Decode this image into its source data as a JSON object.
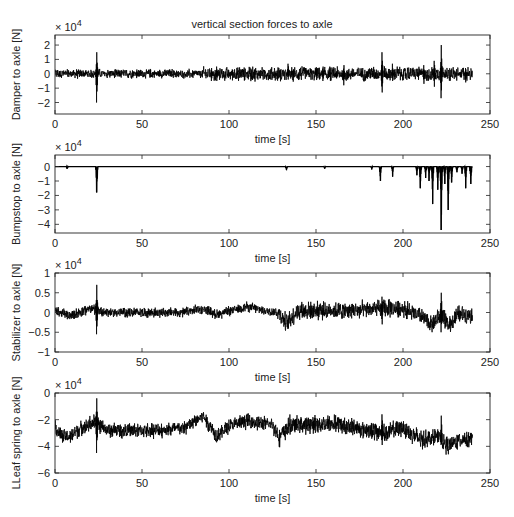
{
  "figure": {
    "title": "vertical section forces to axle",
    "width": 514,
    "height": 517
  },
  "chart_data": [
    {
      "type": "line",
      "title": "vertical section forces to axle",
      "xlabel": "time [s]",
      "ylabel": "Damper to axle [N]",
      "exponent_label": "× 10^4",
      "xlim": [
        0,
        250
      ],
      "ylim": [
        -2.8,
        2.7
      ],
      "xticks": [
        0,
        50,
        100,
        150,
        200,
        250
      ],
      "yticks": [
        -2,
        -1,
        0,
        1,
        2
      ],
      "ytick_labels": [
        "−2",
        "−1",
        "0",
        "1",
        "2"
      ],
      "grid": false,
      "series": [
        {
          "name": "Damper to axle",
          "color": "#000000",
          "t_end": 240,
          "baseline": 0,
          "noise_amplitude": 0.25,
          "spikes": [
            {
              "t": 24,
              "max": 1.5,
              "min": -2.0
            },
            {
              "t": 47,
              "max": 0.3,
              "min": -0.3
            },
            {
              "t": 90,
              "max": 0.4,
              "min": -0.5
            },
            {
              "t": 93,
              "max": 0.5,
              "min": -0.5
            },
            {
              "t": 134,
              "max": 0.7,
              "min": -0.4
            },
            {
              "t": 154,
              "max": 0.5,
              "min": -0.5
            },
            {
              "t": 166,
              "max": 0.6,
              "min": -0.8
            },
            {
              "t": 188,
              "max": 1.5,
              "min": -1.3
            },
            {
              "t": 194,
              "max": 0.7,
              "min": -0.5
            },
            {
              "t": 212,
              "max": 0.6,
              "min": -0.7
            },
            {
              "t": 218,
              "max": 0.9,
              "min": -0.9
            },
            {
              "t": 222,
              "max": 2.0,
              "min": -1.7
            },
            {
              "t": 236,
              "max": 0.4,
              "min": -0.6
            }
          ]
        }
      ]
    },
    {
      "type": "line",
      "title": "",
      "xlabel": "time [s]",
      "ylabel": "Bumpstop to axle [N]",
      "exponent_label": "× 10^4",
      "xlim": [
        0,
        250
      ],
      "ylim": [
        -4.6,
        0.8
      ],
      "xticks": [
        0,
        50,
        100,
        150,
        200,
        250
      ],
      "yticks": [
        -4,
        -3,
        -2,
        -1,
        0
      ],
      "ytick_labels": [
        "−4",
        "−3",
        "−2",
        "−1",
        "0"
      ],
      "grid": false,
      "series": [
        {
          "name": "Bumpstop to axle",
          "color": "#000000",
          "t_end": 240,
          "baseline": 0,
          "noise_amplitude": 0,
          "spikes": [
            {
              "t": 7,
              "max": 0,
              "min": -0.15
            },
            {
              "t": 24,
              "max": 0,
              "min": -1.8
            },
            {
              "t": 133,
              "max": 0,
              "min": -0.25
            },
            {
              "t": 155,
              "max": 0,
              "min": -0.15
            },
            {
              "t": 182,
              "max": 0,
              "min": -0.2
            },
            {
              "t": 187,
              "max": 0,
              "min": -1.0
            },
            {
              "t": 194,
              "max": 0,
              "min": -0.7
            },
            {
              "t": 208,
              "max": 0,
              "min": -0.6
            },
            {
              "t": 210,
              "max": 0,
              "min": -1.5
            },
            {
              "t": 213,
              "max": 0,
              "min": -0.8
            },
            {
              "t": 215,
              "max": 0,
              "min": -1.0
            },
            {
              "t": 217,
              "max": 0,
              "min": -2.6
            },
            {
              "t": 220,
              "max": 0,
              "min": -1.6
            },
            {
              "t": 222,
              "max": 0,
              "min": -4.4
            },
            {
              "t": 224,
              "max": 0,
              "min": -1.2
            },
            {
              "t": 226,
              "max": 0,
              "min": -3.0
            },
            {
              "t": 228,
              "max": 0,
              "min": -1.1
            },
            {
              "t": 231,
              "max": 0,
              "min": -0.4
            },
            {
              "t": 234,
              "max": 0,
              "min": -0.5
            },
            {
              "t": 236,
              "max": 0,
              "min": -1.5
            },
            {
              "t": 239,
              "max": 0,
              "min": -1.2
            }
          ]
        }
      ]
    },
    {
      "type": "line",
      "title": "",
      "xlabel": "time [s]",
      "ylabel": "Stabilizer to axle [N]",
      "exponent_label": "× 10^4",
      "xlim": [
        0,
        250
      ],
      "ylim": [
        -1,
        1
      ],
      "xticks": [
        0,
        50,
        100,
        150,
        200,
        250
      ],
      "yticks": [
        -1,
        -0.5,
        0,
        0.5,
        1
      ],
      "ytick_labels": [
        "−1",
        "−0.5",
        "0",
        "0.5",
        "1"
      ],
      "grid": false,
      "series": [
        {
          "name": "Stabilizer to axle",
          "color": "#000000",
          "t_end": 240,
          "trend": [
            [
              0,
              0.05
            ],
            [
              8,
              -0.08
            ],
            [
              20,
              0.1
            ],
            [
              30,
              0.0
            ],
            [
              60,
              0.0
            ],
            [
              75,
              0.0
            ],
            [
              85,
              0.1
            ],
            [
              93,
              -0.05
            ],
            [
              110,
              0.15
            ],
            [
              120,
              0.05
            ],
            [
              128,
              0.0
            ],
            [
              133,
              -0.25
            ],
            [
              140,
              0.05
            ],
            [
              170,
              0.05
            ],
            [
              190,
              0.1
            ],
            [
              200,
              0.1
            ],
            [
              210,
              -0.1
            ],
            [
              217,
              -0.3
            ],
            [
              222,
              -0.05
            ],
            [
              226,
              -0.35
            ],
            [
              232,
              -0.05
            ],
            [
              240,
              -0.05
            ]
          ],
          "noise_amplitude": 0.1,
          "spikes": [
            {
              "t": 24,
              "max": 0.7,
              "min": -0.55
            },
            {
              "t": 188,
              "max": 0.4,
              "min": -0.3
            },
            {
              "t": 222,
              "max": 0.5,
              "min": -0.5
            }
          ]
        }
      ]
    },
    {
      "type": "line",
      "title": "",
      "xlabel": "time [s]",
      "ylabel": "LLeaf spring to axle [N]",
      "exponent_label": "× 10^4",
      "xlim": [
        0,
        250
      ],
      "ylim": [
        -6,
        0
      ],
      "xticks": [
        0,
        50,
        100,
        150,
        200,
        250
      ],
      "yticks": [
        -6,
        -4,
        -2,
        0
      ],
      "ytick_labels": [
        "−6",
        "−4",
        "−2",
        "0"
      ],
      "grid": false,
      "series": [
        {
          "name": "LLeaf spring to axle",
          "color": "#000000",
          "t_end": 240,
          "trend": [
            [
              0,
              -2.5
            ],
            [
              3,
              -3.2
            ],
            [
              8,
              -3.3
            ],
            [
              15,
              -2.6
            ],
            [
              22,
              -2.2
            ],
            [
              30,
              -2.8
            ],
            [
              60,
              -2.8
            ],
            [
              75,
              -2.6
            ],
            [
              85,
              -1.7
            ],
            [
              93,
              -3.2
            ],
            [
              100,
              -2.5
            ],
            [
              110,
              -2.1
            ],
            [
              125,
              -2.4
            ],
            [
              129,
              -3.3
            ],
            [
              135,
              -2.4
            ],
            [
              160,
              -2.3
            ],
            [
              190,
              -3.0
            ],
            [
              200,
              -2.6
            ],
            [
              210,
              -3.5
            ],
            [
              220,
              -3.3
            ],
            [
              226,
              -4.0
            ],
            [
              232,
              -3.5
            ],
            [
              240,
              -3.4
            ]
          ],
          "noise_amplitude": 0.45,
          "spikes": [
            {
              "t": 24,
              "max": -0.4,
              "min": -4.5
            },
            {
              "t": 188,
              "max": -1.6,
              "min": -3.9
            },
            {
              "t": 222,
              "max": -1.7,
              "min": -3.9
            }
          ]
        }
      ]
    }
  ]
}
